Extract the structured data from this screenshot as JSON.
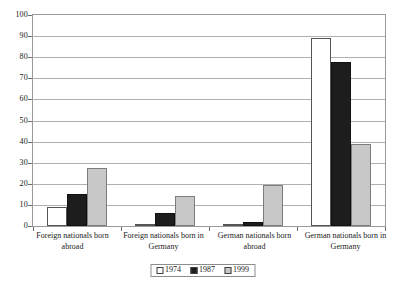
{
  "chart_data": {
    "type": "bar",
    "title": "",
    "subtitle": "",
    "xlabel": "",
    "ylabel": "",
    "ylim": [
      0,
      100
    ],
    "ytick_step": 10,
    "yticks": [
      "100",
      "90",
      "80",
      "70",
      "60",
      "50",
      "40",
      "30",
      "20",
      "10",
      "0"
    ],
    "grid": true,
    "legend_position": "bottom",
    "categories": [
      "Foreign nationals born abroad",
      "Foreign nationals born in Germany",
      "German nationals born abroad",
      "German nationals born in Germany"
    ],
    "series": [
      {
        "name": "1974",
        "color": "#ffffff",
        "values": [
          9,
          1,
          0.7,
          89
        ]
      },
      {
        "name": "1987",
        "color": "#1d1d1d",
        "values": [
          15,
          6,
          1.8,
          77.5
        ]
      },
      {
        "name": "1999",
        "color": "#c8c8c8",
        "values": [
          27.5,
          14,
          19.5,
          39
        ]
      }
    ]
  },
  "legend": {
    "items": [
      {
        "label": "1974"
      },
      {
        "label": "1987"
      },
      {
        "label": "1999"
      }
    ]
  },
  "axes": {
    "frame_color": "#9a9a9a",
    "grid_color": "#b0b0b0",
    "tick_color": "#6f6f6f"
  }
}
